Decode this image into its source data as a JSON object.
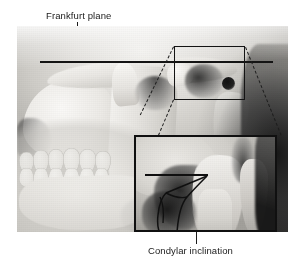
{
  "figure": {
    "type": "anatomical-photograph-with-annotations",
    "background_color": "#ffffff",
    "image_color_mode": "grayscale"
  },
  "labels": {
    "frankfurt_plane": "Frankfurt plane",
    "condylar_inclination": "Condylar inclination"
  },
  "annotations": {
    "frankfurt_plane_line": {
      "name": "frankfurt-plane-reference-line",
      "orientation": "horizontal",
      "color": "#141414"
    },
    "roi_box": {
      "name": "region-of-interest-box",
      "shape": "rectangle",
      "color": "#141414"
    },
    "magnified_inset": {
      "name": "magnified-inset-panel",
      "shape": "rectangle",
      "border_color": "#101010"
    },
    "connector_lines": {
      "name": "dashed-magnification-connectors",
      "style": "dashed",
      "count": 3,
      "color": "#1d1d1d"
    },
    "inset_horizontal_reference": {
      "name": "inset-horizontal-reference-line",
      "color": "#101010"
    },
    "inset_inclination_line": {
      "name": "condylar-inclination-angle-line",
      "color": "#101010"
    },
    "leader_lines": {
      "frankfurt": "frankfurt-plane-leader-line",
      "condylar": "condylar-inclination-leader-line"
    }
  }
}
